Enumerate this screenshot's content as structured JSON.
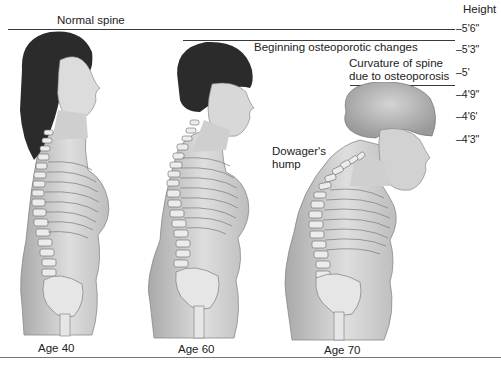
{
  "labels": {
    "normal": "Normal spine",
    "beginning": "Beginning osteoporotic changes",
    "curvature_line1": "Curvature of spine",
    "curvature_line2": "due to osteoporosis",
    "dowager_line1": "Dowager's",
    "dowager_line2": "hump"
  },
  "height_scale": {
    "title": "Height",
    "ticks": [
      "–5'6\"",
      "–5'3\"",
      "–5'",
      "–4'9\"",
      "–4'6'",
      "–4'3\""
    ]
  },
  "figures": [
    {
      "age_label": "Age 40",
      "stage": "Normal spine"
    },
    {
      "age_label": "Age 60",
      "stage": "Beginning osteoporotic changes"
    },
    {
      "age_label": "Age 70",
      "stage": "Curvature of spine due to osteoporosis"
    }
  ],
  "colors": {
    "skin": "#d9d9d9",
    "skin_shadow": "#a8a8a8",
    "hair_dark": "#2b2b2b",
    "hair_gray": "#b5b5b5",
    "bone": "#e8e8e8",
    "outline": "#555555"
  }
}
